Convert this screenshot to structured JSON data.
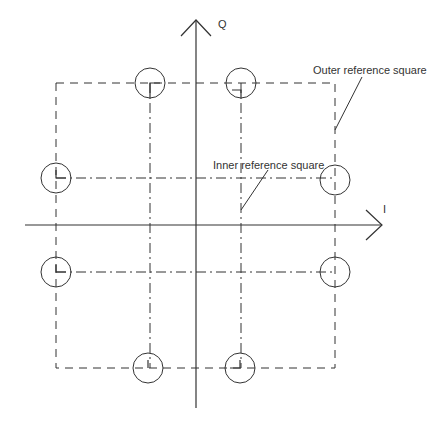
{
  "diagram": {
    "type": "constellation-diagram",
    "axes": {
      "q_label": "Q",
      "i_label": "I"
    },
    "annotations": {
      "outer": "Outer reference square",
      "inner": "Inner reference square"
    },
    "points": [
      {
        "name": "top-left",
        "x": 150,
        "y": 83
      },
      {
        "name": "top-right",
        "x": 241,
        "y": 83
      },
      {
        "name": "left-upper",
        "x": 56,
        "y": 178
      },
      {
        "name": "right-upper",
        "x": 335,
        "y": 180
      },
      {
        "name": "left-lower",
        "x": 56,
        "y": 272
      },
      {
        "name": "right-lower",
        "x": 335,
        "y": 272
      },
      {
        "name": "bottom-left",
        "x": 148,
        "y": 368
      },
      {
        "name": "bottom-right",
        "x": 240,
        "y": 368
      }
    ],
    "colors": {
      "line": "#333333",
      "background": "#ffffff"
    }
  }
}
